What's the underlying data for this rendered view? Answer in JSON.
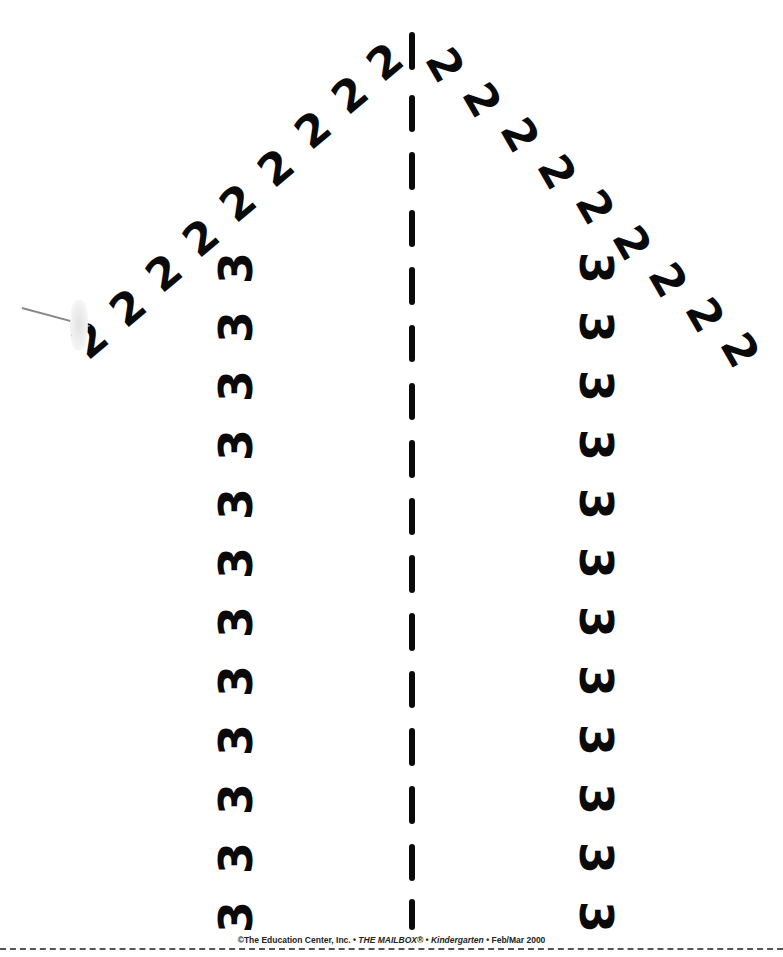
{
  "worksheet": {
    "digit_two": "2",
    "digit_three": "3",
    "left_twos": [
      {
        "x": 90,
        "y": 340
      },
      {
        "x": 128,
        "y": 308
      },
      {
        "x": 164,
        "y": 273
      },
      {
        "x": 201,
        "y": 238
      },
      {
        "x": 238,
        "y": 203
      },
      {
        "x": 276,
        "y": 168
      },
      {
        "x": 313,
        "y": 130
      },
      {
        "x": 350,
        "y": 95
      },
      {
        "x": 385,
        "y": 62
      }
    ],
    "right_twos": [
      {
        "x": 445,
        "y": 65
      },
      {
        "x": 482,
        "y": 100
      },
      {
        "x": 520,
        "y": 135
      },
      {
        "x": 557,
        "y": 172
      },
      {
        "x": 595,
        "y": 207
      },
      {
        "x": 632,
        "y": 243
      },
      {
        "x": 668,
        "y": 280
      },
      {
        "x": 705,
        "y": 315
      },
      {
        "x": 740,
        "y": 350
      }
    ],
    "left_threes_x": 236,
    "right_threes_x": 596,
    "threes_y": [
      268,
      327,
      386,
      445,
      504,
      563,
      622,
      681,
      740,
      799,
      858,
      917
    ],
    "left_two_rotation_deg": -40,
    "right_two_rotation_deg": 60,
    "left_three_rotation_deg": -90,
    "right_three_rotation_deg": 90,
    "center_line": {
      "x": 412,
      "dashes_y": [
        [
          32,
          70
        ],
        [
          95,
          132
        ],
        [
          152,
          190
        ],
        [
          210,
          247
        ],
        [
          267,
          305
        ],
        [
          325,
          362
        ],
        [
          383,
          420
        ],
        [
          440,
          478
        ],
        [
          498,
          535
        ],
        [
          555,
          593
        ],
        [
          613,
          651
        ],
        [
          671,
          708
        ],
        [
          728,
          766
        ],
        [
          786,
          824
        ],
        [
          844,
          881
        ],
        [
          899,
          930
        ]
      ]
    },
    "ink_color": "#0a0a0a"
  },
  "footer": {
    "copyright": "©The Education Center, Inc. • ",
    "magazine": "THE MAILBOX® • Kindergarten",
    "issue": " • Feb/Mar 2000"
  }
}
